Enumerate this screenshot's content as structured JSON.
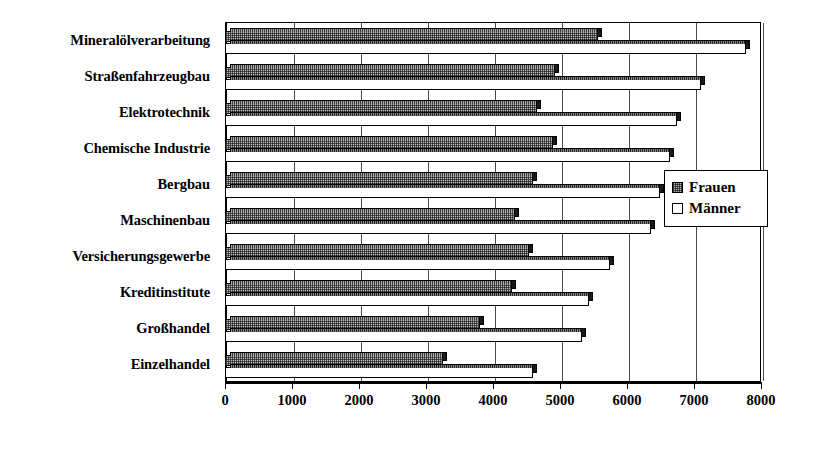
{
  "chart_data": {
    "type": "bar",
    "orientation": "horizontal",
    "title": "",
    "xlabel": "",
    "ylabel": "",
    "xlim": [
      0,
      8000
    ],
    "xticks": [
      0,
      1000,
      2000,
      3000,
      4000,
      5000,
      6000,
      7000,
      8000
    ],
    "xtick_labels": [
      "0",
      "1000",
      "2000",
      "3000",
      "4000",
      "5000",
      "6000",
      "7000",
      "8000"
    ],
    "grid": true,
    "grid_axis": "x",
    "legend_position": "right-middle",
    "categories": [
      "Mineralölverarbeitung",
      "Straßenfahrzeugbau",
      "Elektrotechnik",
      "Chemische Industrie",
      "Bergbau",
      "Maschinenbau",
      "Versicherungsgewerbe",
      "Kreditinstitute",
      "Großhandel",
      "Einzelhandel"
    ],
    "series": [
      {
        "name": "Frauen",
        "fill": "hatched-grey",
        "values": [
          5570,
          4920,
          4660,
          4890,
          4590,
          4330,
          4540,
          4280,
          3800,
          3260
        ]
      },
      {
        "name": "Männer",
        "fill": "white",
        "values": [
          7770,
          7110,
          6740,
          6640,
          6490,
          6360,
          5740,
          5430,
          5330,
          4590
        ]
      }
    ]
  },
  "legend": {
    "items": [
      {
        "label": "Frauen",
        "swatch": "hatched-grey"
      },
      {
        "label": "Männer",
        "swatch": "white"
      }
    ]
  },
  "colors": {
    "axis": "#000000",
    "grid": "#4a4a4a",
    "frauen_fill": "#b9b9b9",
    "maenner_fill": "#ffffff",
    "bar_outline": "#000000",
    "background": "#ffffff"
  }
}
